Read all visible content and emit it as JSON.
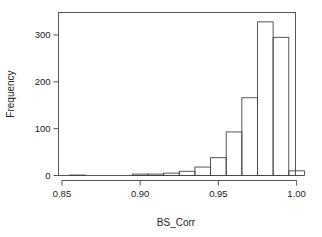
{
  "chart_data": {
    "type": "bar",
    "subtype": "histogram",
    "title": "",
    "xlabel": "BS_Corr",
    "ylabel": "Frequency",
    "xlim": [
      0.8478,
      0.9993
    ],
    "ylim": [
      0,
      348
    ],
    "grid": false,
    "legend": null,
    "x_ticks": [
      0.85,
      0.9,
      0.95,
      1.0
    ],
    "x_tick_labels": [
      "0.85",
      "0.90",
      "0.95",
      "1.00"
    ],
    "y_ticks": [
      0,
      100,
      200,
      300
    ],
    "y_tick_labels": [
      "0",
      "100",
      "200",
      "300"
    ],
    "bin_width": 0.01,
    "bin_edges": [
      0.855,
      0.865,
      0.875,
      0.885,
      0.895,
      0.905,
      0.915,
      0.925,
      0.935,
      0.945,
      0.955,
      0.965,
      0.975,
      0.985,
      0.995,
      1.005
    ],
    "categories": [
      "0.855-0.865",
      "0.865-0.875",
      "0.875-0.885",
      "0.885-0.895",
      "0.895-0.905",
      "0.905-0.915",
      "0.915-0.925",
      "0.925-0.935",
      "0.935-0.945",
      "0.945-0.955",
      "0.955-0.965",
      "0.965-0.975",
      "0.975-0.985",
      "0.985-0.995",
      "0.995-1.005"
    ],
    "values": [
      1,
      0,
      0,
      0,
      3,
      3,
      5,
      9,
      18,
      38,
      93,
      166,
      328,
      295,
      10
    ],
    "bar_color": "#ffffff",
    "bar_edge_color": "#444444",
    "axis_color": "#555555"
  },
  "axes": {
    "x_label": "BS_Corr",
    "y_label": "Frequency"
  }
}
